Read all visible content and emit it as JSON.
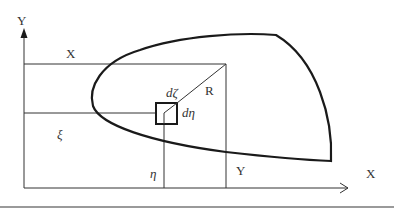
{
  "diagram": {
    "axes": {
      "y_axis_label": "Y",
      "x_axis_label": "X"
    },
    "labels": {
      "x_coord": "X",
      "y_coord": "Y",
      "xi": "ξ",
      "eta": "η",
      "d_zeta": "dζ",
      "d_eta": "dη",
      "radius": "R"
    },
    "colors": {
      "line": "#333333",
      "curve": "#1a1a1a",
      "separator": "#9a9a9a",
      "background": "#ffffff"
    }
  }
}
